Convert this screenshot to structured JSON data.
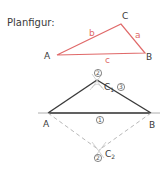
{
  "title": "Planfigur:",
  "plan_figure": {
    "vertices": {
      "A": "A",
      "B": "B",
      "C": "C"
    },
    "sides": {
      "a": "a",
      "b": "b",
      "c": "c"
    },
    "color": "#e06a6a"
  },
  "construction": {
    "vertices": {
      "A": "A",
      "B": "B"
    },
    "c1_label": "C",
    "c1_sub": "1",
    "c2_label": "C",
    "c2_sub": "2",
    "steps": {
      "step1": "1",
      "step2": "2",
      "step3": "3"
    },
    "line_color": "#3a3a3a",
    "dashed_color": "#b8b8b8"
  }
}
